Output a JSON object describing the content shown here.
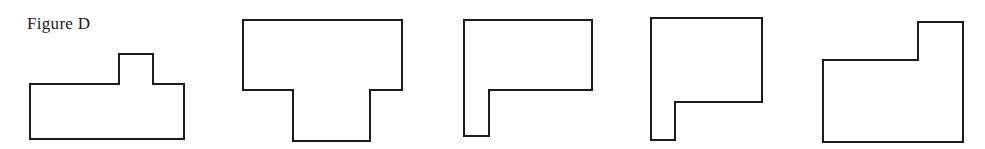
{
  "figure": {
    "caption": "Figure D",
    "background_color": "#ffffff",
    "stroke_color": "#1c1c1c",
    "fill_color": "#ffffff",
    "stroke_width": 2,
    "canvas": {
      "width": 985,
      "height": 149
    }
  },
  "shapes": [
    {
      "id": "shape-1",
      "name": "rectangle-with-top-tab",
      "description": "Wide rectangle with a small square tab protruding upward, right of center",
      "points": "30,84 119,84 119,54 153,54 153,84 184,84 184,139 30,139",
      "bbox": {
        "x": 30,
        "y": 54,
        "width": 154,
        "height": 85
      }
    },
    {
      "id": "shape-2",
      "name": "rectangle-with-bottom-tab-center",
      "description": "Wide rectangle with a wide tab hanging below, centered",
      "points": "243,20 402,20 402,90 370,90 370,141 293,141 293,90 243,90",
      "bbox": {
        "x": 243,
        "y": 20,
        "width": 159,
        "height": 121
      }
    },
    {
      "id": "shape-3",
      "name": "rectangle-with-bottom-tab-left",
      "description": "Wide rectangle with a narrow tab hanging below at the left edge",
      "points": "464,20 592,20 592,90 489,90 489,136 464,136",
      "bbox": {
        "x": 464,
        "y": 20,
        "width": 128,
        "height": 116
      }
    },
    {
      "id": "shape-4",
      "name": "rectangle-with-bottom-tab-left-narrow",
      "description": "Narrower rectangle with a narrow tab hanging below at the left edge",
      "points": "651,18 762,18 762,102 675,102 675,140 651,140",
      "bbox": {
        "x": 651,
        "y": 18,
        "width": 111,
        "height": 122
      }
    },
    {
      "id": "shape-5",
      "name": "l-shape-step-upper-left",
      "description": "L-shaped polygon with a step notch cut out of the upper-left corner",
      "points": "918,22 963,22 963,142 823,142 823,60 918,60",
      "bbox": {
        "x": 823,
        "y": 22,
        "width": 140,
        "height": 120
      }
    }
  ]
}
